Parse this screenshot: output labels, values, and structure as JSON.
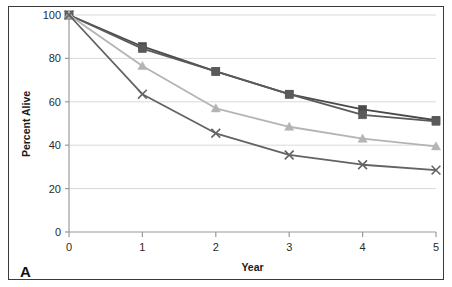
{
  "figure": {
    "panel_label": "A",
    "border_color": "#3a3a3a",
    "background": "#ffffff"
  },
  "chart_data": {
    "type": "line",
    "title": "",
    "xlabel": "Year",
    "ylabel": "Percent Alive",
    "x": [
      0,
      1,
      2,
      3,
      4,
      5
    ],
    "xlim": [
      0,
      5
    ],
    "ylim": [
      0,
      100
    ],
    "xticks": [
      "0",
      "1",
      "2",
      "3",
      "4",
      "5"
    ],
    "yticks": [
      "0",
      "20",
      "40",
      "60",
      "80",
      "100"
    ],
    "grid": "horizontal",
    "legend": "none",
    "series": [
      {
        "name": "Series 1",
        "marker": "square",
        "color": "#4a4a4a",
        "values": [
          100,
          85.5,
          74,
          63.5,
          56.5,
          51.5
        ]
      },
      {
        "name": "Series 2",
        "marker": "square",
        "color": "#5a5a5a",
        "values": [
          100,
          84.5,
          74,
          63.5,
          54,
          51
        ]
      },
      {
        "name": "Series 3",
        "marker": "triangle",
        "color": "#b4b4b4",
        "values": [
          100,
          76.5,
          57,
          48.5,
          43,
          39.5
        ]
      },
      {
        "name": "Series 4",
        "marker": "cross",
        "color": "#636363",
        "values": [
          100,
          63.5,
          45.5,
          35.5,
          31,
          28.5
        ]
      }
    ]
  }
}
